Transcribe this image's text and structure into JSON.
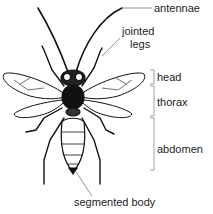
{
  "diagram": {
    "labels": {
      "antennae": "antennae",
      "jointed_legs_line1": "jointed",
      "jointed_legs_line2": "legs",
      "head": "head",
      "thorax": "thorax",
      "abdomen": "abdomen",
      "segmented_body": "segmented body"
    },
    "colors": {
      "ink": "#111111",
      "leader_line": "#777777",
      "bracket": "#888888",
      "text": "#222222",
      "background": "#ffffff"
    }
  }
}
